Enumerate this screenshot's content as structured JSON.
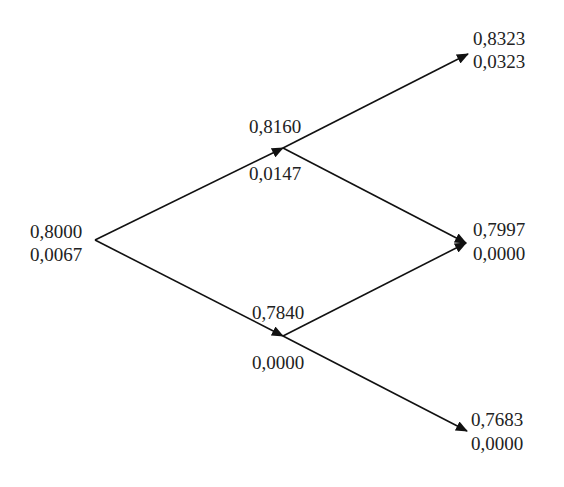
{
  "diagram": {
    "type": "binomial-tree",
    "steps": 2,
    "line_color": "#111111",
    "text_color": "#222222",
    "nodes": {
      "root": {
        "price": "0,8000",
        "value": "0,0067"
      },
      "up": {
        "price": "0,8160",
        "value": "0,0147"
      },
      "down": {
        "price": "0,7840",
        "value": "0,0000"
      },
      "up_up": {
        "price": "0,8323",
        "value": "0,0323"
      },
      "up_down": {
        "price": "0,7997",
        "value": "0,0000"
      },
      "down_down": {
        "price": "0,7683",
        "value": "0,0000"
      }
    },
    "edges": [
      {
        "from": "root",
        "to": "up"
      },
      {
        "from": "root",
        "to": "down"
      },
      {
        "from": "up",
        "to": "up_up"
      },
      {
        "from": "up",
        "to": "up_down"
      },
      {
        "from": "down",
        "to": "up_down"
      },
      {
        "from": "down",
        "to": "down_down"
      }
    ]
  }
}
